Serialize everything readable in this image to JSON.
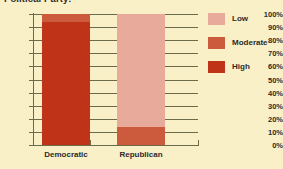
{
  "chart_data": {
    "type": "bar",
    "title": "Political Party:",
    "xlabel": "",
    "ylabel": "",
    "ylim": [
      0,
      100
    ],
    "grid": true,
    "stacked": true,
    "legend_position": "right",
    "categories": [
      "Democratic",
      "Republican"
    ],
    "tick_labels": [
      "100%",
      "90%",
      "80%",
      "70%",
      "60%",
      "50%",
      "40%",
      "30%",
      "20%",
      "10%",
      "0%"
    ],
    "tick_values": [
      100,
      90,
      80,
      70,
      60,
      50,
      40,
      30,
      20,
      10,
      0
    ],
    "series": [
      {
        "name": "High",
        "color": "#bf3418",
        "values": [
          94,
          0
        ]
      },
      {
        "name": "Moderate",
        "color": "#cc5a3d",
        "values": [
          6,
          14
        ]
      },
      {
        "name": "Low",
        "color": "#e8aa9a",
        "values": [
          0,
          86
        ]
      }
    ],
    "legend": [
      {
        "label": "Low",
        "color": "#e8aa9a"
      },
      {
        "label": "Moderate",
        "color": "#cc5a3d"
      },
      {
        "label": "High",
        "color": "#bf3418"
      }
    ],
    "colors": {
      "background": "#faf0c8",
      "axis": "#6b6b4a",
      "text": "#2b2b2b"
    }
  }
}
